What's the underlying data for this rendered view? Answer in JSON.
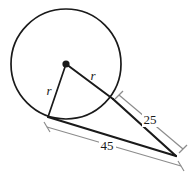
{
  "diagram": {
    "kind": "circle-tangent-geometry",
    "background_color": "#ffffff",
    "stroke_color": "#1a1a1a",
    "dimension_line_color": "#8c8c8c",
    "circle": {
      "center_x": 66,
      "center_y": 64,
      "radius": 55,
      "center_dot_radius": 3.6,
      "stroke_width": 1.7
    },
    "external_point": {
      "x": 176,
      "y": 156
    },
    "tangent_point_upper": {
      "x": 113,
      "y": 99
    },
    "tangent_point_lower": {
      "x": 48,
      "y": 117
    },
    "labels": {
      "radius_left": {
        "text": "r",
        "x": 49,
        "y": 95,
        "font_size": 13
      },
      "radius_right": {
        "text": "r",
        "x": 93,
        "y": 80,
        "font_size": 13
      },
      "segment_upper": {
        "text": "25",
        "x": 150,
        "y": 124,
        "font_size": 13
      },
      "segment_lower": {
        "text": "45",
        "x": 107,
        "y": 150,
        "font_size": 13
      }
    },
    "dimension_upper": {
      "from_x": 119,
      "from_y": 95,
      "to_x": 183,
      "to_y": 148,
      "tick_length": 9
    },
    "dimension_lower": {
      "from_x": 47,
      "from_y": 127,
      "to_x": 181,
      "to_y": 166,
      "tick_length": 9
    }
  }
}
